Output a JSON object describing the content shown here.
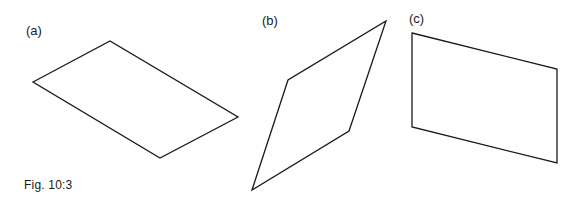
{
  "figure": {
    "caption": "Fig. 10:3",
    "panels": [
      {
        "label": "(a)",
        "shape": "parallelogram",
        "points": "33,82 110,41 238,117 160,158"
      },
      {
        "label": "(b)",
        "shape": "parallelogram",
        "points": "252,190 288,80 386,21 349,131"
      },
      {
        "label": "(c)",
        "shape": "parallelogram",
        "points": "412,33 557,69 557,163 412,127"
      }
    ],
    "colors": {
      "stroke": "#1a1a1a",
      "background": "#ffffff"
    }
  }
}
